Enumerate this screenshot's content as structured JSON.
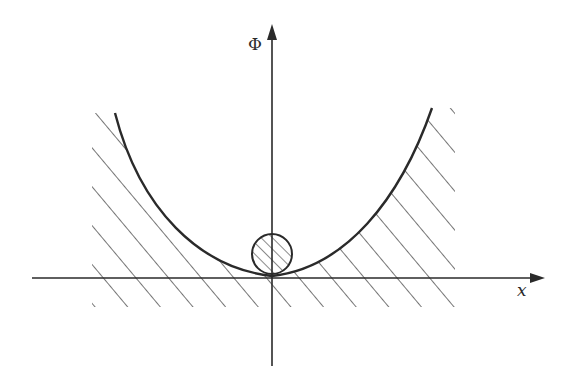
{
  "diagram": {
    "axes": {
      "vertical_label": "Φ",
      "horizontal_label": "x"
    },
    "elements": [
      {
        "name": "potential-curve",
        "shape": "parabola",
        "vertex": "origin"
      },
      {
        "name": "ball",
        "shape": "circle",
        "fill": "hatched",
        "position": "bottom of well"
      },
      {
        "name": "forbidden-region",
        "fill": "hatched",
        "location": "outside/below curve and below x-axis"
      }
    ],
    "colors": {
      "stroke": "#2a2a2a",
      "background": "#ffffff"
    }
  }
}
